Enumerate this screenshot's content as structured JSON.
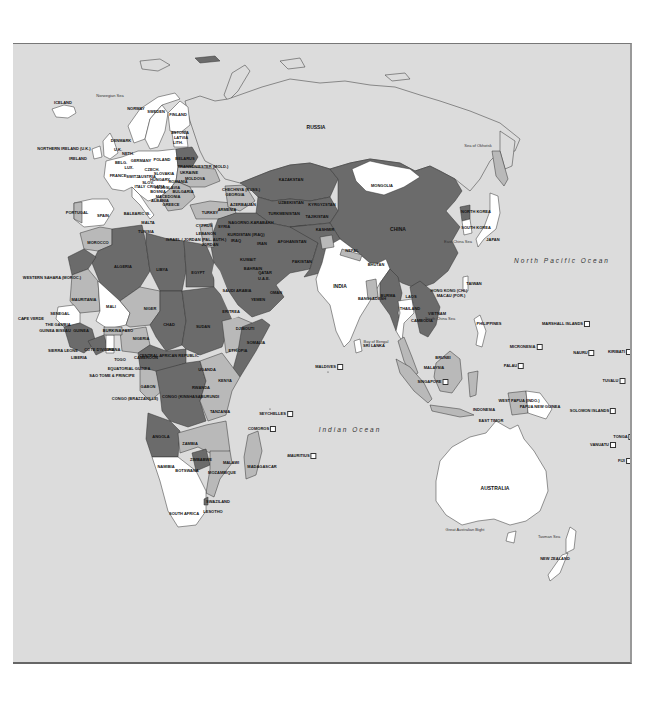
{
  "map": {
    "colors": {
      "ocean": "#dcdcdc",
      "dark": "#6b6b6b",
      "medium": "#b9b9b9",
      "light": "#ffffff",
      "border": "#333333"
    },
    "oceans": [
      {
        "id": "north-pacific",
        "label": "North Pacific Ocean",
        "x": 562,
        "y": 259
      },
      {
        "id": "indian",
        "label": "Indian Ocean",
        "x": 350,
        "y": 428
      }
    ],
    "seas": [
      {
        "id": "norwegian-sea",
        "label": "Norwegian Sea",
        "x": 110,
        "y": 95
      },
      {
        "id": "sea-of-okhotsk",
        "label": "Sea of Okhotsk",
        "x": 478,
        "y": 145
      },
      {
        "id": "east-china-sea",
        "label": "East China Sea",
        "x": 458,
        "y": 241
      },
      {
        "id": "south-china-sea",
        "label": "South China Sea",
        "x": 440,
        "y": 318
      },
      {
        "id": "bay-of-bengal",
        "label": "Bay of Bengal",
        "x": 376,
        "y": 341
      },
      {
        "id": "great-australian-bight",
        "label": "Great Australian Bight",
        "x": 465,
        "y": 529
      },
      {
        "id": "tasman-sea",
        "label": "Tasman Sea",
        "x": 549,
        "y": 536
      }
    ],
    "countries": [
      {
        "id": "iceland",
        "label": "ICELAND",
        "x": 63,
        "y": 102
      },
      {
        "id": "norway",
        "label": "NORWAY",
        "x": 136,
        "y": 108
      },
      {
        "id": "sweden",
        "label": "SWEDEN",
        "x": 156,
        "y": 111
      },
      {
        "id": "finland",
        "label": "FINLAND",
        "x": 178,
        "y": 114
      },
      {
        "id": "estonia",
        "label": "ESTONIA",
        "x": 180,
        "y": 132
      },
      {
        "id": "latvia",
        "label": "LATVIA",
        "x": 181,
        "y": 137
      },
      {
        "id": "lithuania",
        "label": "LITH.",
        "x": 178,
        "y": 142
      },
      {
        "id": "denmark",
        "label": "DENMARK",
        "x": 121,
        "y": 140
      },
      {
        "id": "northern-ireland",
        "label": "NORTHERN IRELAND (U.K.)",
        "x": 64,
        "y": 148
      },
      {
        "id": "uk",
        "label": "U.K.",
        "x": 118,
        "y": 149
      },
      {
        "id": "ireland",
        "label": "IRELAND",
        "x": 78,
        "y": 158
      },
      {
        "id": "netherlands",
        "label": "NETH.",
        "x": 128,
        "y": 153
      },
      {
        "id": "germany",
        "label": "GERMANY",
        "x": 141,
        "y": 160
      },
      {
        "id": "poland",
        "label": "POLAND",
        "x": 162,
        "y": 159
      },
      {
        "id": "belarus",
        "label": "BELARUS",
        "x": 185,
        "y": 158
      },
      {
        "id": "belgium",
        "label": "BELG.",
        "x": 121,
        "y": 162
      },
      {
        "id": "luxembourg",
        "label": "LUX.",
        "x": 129,
        "y": 167
      },
      {
        "id": "czech",
        "label": "CZECH.",
        "x": 152,
        "y": 169
      },
      {
        "id": "slovakia",
        "label": "SLOVAKIA",
        "x": 164,
        "y": 173
      },
      {
        "id": "ukraine",
        "label": "UKRAINE",
        "x": 189,
        "y": 172
      },
      {
        "id": "transdniester",
        "label": "TRANSDNIESTER (MOLD.)",
        "x": 203,
        "y": 166
      },
      {
        "id": "moldova",
        "label": "MOLDOVA",
        "x": 195,
        "y": 178
      },
      {
        "id": "france",
        "label": "FRANCE",
        "x": 118,
        "y": 175
      },
      {
        "id": "switzerland",
        "label": "SWITZ.",
        "x": 133,
        "y": 176
      },
      {
        "id": "austria",
        "label": "AUSTRIA",
        "x": 147,
        "y": 176
      },
      {
        "id": "hungary",
        "label": "HUNGARY",
        "x": 160,
        "y": 179
      },
      {
        "id": "romania",
        "label": "ROMANIA",
        "x": 178,
        "y": 181
      },
      {
        "id": "slovenia",
        "label": "SLOV.",
        "x": 148,
        "y": 182
      },
      {
        "id": "croatia",
        "label": "CROATIA",
        "x": 156,
        "y": 186
      },
      {
        "id": "yugoslavia",
        "label": "YUGOSLAVIA",
        "x": 167,
        "y": 187
      },
      {
        "id": "italy",
        "label": "ITALY",
        "x": 140,
        "y": 186
      },
      {
        "id": "bosnia",
        "label": "BOSNIA",
        "x": 158,
        "y": 191
      },
      {
        "id": "bulgaria",
        "label": "BULGARIA",
        "x": 183,
        "y": 191
      },
      {
        "id": "macedonia",
        "label": "MACEDONIA",
        "x": 168,
        "y": 196
      },
      {
        "id": "albania",
        "label": "ALBANIA",
        "x": 160,
        "y": 200
      },
      {
        "id": "greece",
        "label": "GREECE",
        "x": 171,
        "y": 204
      },
      {
        "id": "chechnya",
        "label": "CHECHNYA (RUSS.)",
        "x": 241,
        "y": 189
      },
      {
        "id": "georgia",
        "label": "GEORGIA",
        "x": 235,
        "y": 194
      },
      {
        "id": "armenia",
        "label": "ARMENIA",
        "x": 227,
        "y": 209
      },
      {
        "id": "azerbaijan",
        "label": "AZERBAIJAN",
        "x": 243,
        "y": 204
      },
      {
        "id": "turkey",
        "label": "TURKEY",
        "x": 210,
        "y": 212
      },
      {
        "id": "portugal",
        "label": "PORTUGAL",
        "x": 77,
        "y": 212
      },
      {
        "id": "spain",
        "label": "SPAIN",
        "x": 103,
        "y": 215
      },
      {
        "id": "balearic",
        "label": "BALEARIC IS.",
        "x": 137,
        "y": 213
      },
      {
        "id": "malta",
        "label": "MALTA",
        "x": 148,
        "y": 222
      },
      {
        "id": "tunisia",
        "label": "TUNISIA",
        "x": 146,
        "y": 231
      },
      {
        "id": "cyprus",
        "label": "CYPRUS",
        "x": 204,
        "y": 225
      },
      {
        "id": "lebanon",
        "label": "LEBANON",
        "x": 206,
        "y": 233
      },
      {
        "id": "israel",
        "label": "ISRAEL / JORDAN (PAL. AUTH.)",
        "x": 196,
        "y": 239
      },
      {
        "id": "jordan",
        "label": "JORDAN",
        "x": 210,
        "y": 244
      },
      {
        "id": "syria",
        "label": "SYRIA",
        "x": 224,
        "y": 226
      },
      {
        "id": "iraq",
        "label": "IRAQ",
        "x": 236,
        "y": 240
      },
      {
        "id": "iran",
        "label": "IRAN",
        "x": 262,
        "y": 243
      },
      {
        "id": "kurdistan",
        "label": "KURDISTAN (IRAQ)",
        "x": 246,
        "y": 234
      },
      {
        "id": "nagorno",
        "label": "NAGORNO-KARABAKH",
        "x": 251,
        "y": 222
      },
      {
        "id": "morocco",
        "label": "MOROCCO",
        "x": 98,
        "y": 242
      },
      {
        "id": "algeria",
        "label": "ALGERIA",
        "x": 123,
        "y": 266
      },
      {
        "id": "libya",
        "label": "LIBYA",
        "x": 162,
        "y": 269
      },
      {
        "id": "egypt",
        "label": "EGYPT",
        "x": 198,
        "y": 272
      },
      {
        "id": "western-sahara",
        "label": "WESTERN SAHARA (MOROC.)",
        "x": 52,
        "y": 277
      },
      {
        "id": "mauritania",
        "label": "MAURITANIA",
        "x": 84,
        "y": 299
      },
      {
        "id": "mali",
        "label": "MALI",
        "x": 111,
        "y": 306
      },
      {
        "id": "niger",
        "label": "NIGER",
        "x": 150,
        "y": 308
      },
      {
        "id": "chad",
        "label": "CHAD",
        "x": 169,
        "y": 324
      },
      {
        "id": "sudan",
        "label": "SUDAN",
        "x": 203,
        "y": 326
      },
      {
        "id": "eritrea",
        "label": "ERITREA",
        "x": 231,
        "y": 311
      },
      {
        "id": "senegal",
        "label": "SENEGAL",
        "x": 60,
        "y": 313
      },
      {
        "id": "cape-verde",
        "label": "CAPE VERDE",
        "x": 31,
        "y": 318
      },
      {
        "id": "the-gambia",
        "label": "THE GAMBIA",
        "x": 58,
        "y": 324
      },
      {
        "id": "guinea-bissau",
        "label": "GUINEA BISSAU",
        "x": 55,
        "y": 330
      },
      {
        "id": "guinea",
        "label": "GUINEA",
        "x": 81,
        "y": 330
      },
      {
        "id": "burkina-faso",
        "label": "BURKINA FASO",
        "x": 118,
        "y": 330
      },
      {
        "id": "nigeria",
        "label": "NIGERIA",
        "x": 141,
        "y": 338
      },
      {
        "id": "djibouti",
        "label": "DJIBOUTI",
        "x": 245,
        "y": 328
      },
      {
        "id": "somalia",
        "label": "SOMALIA",
        "x": 256,
        "y": 342
      },
      {
        "id": "ethiopia",
        "label": "ETHIOPIA",
        "x": 238,
        "y": 350
      },
      {
        "id": "sierra-leone",
        "label": "SIERRA LEONE",
        "x": 63,
        "y": 350
      },
      {
        "id": "cote-divoire",
        "label": "COTE D'IVOIRE",
        "x": 99,
        "y": 349
      },
      {
        "id": "ghana",
        "label": "GHANA",
        "x": 113,
        "y": 349
      },
      {
        "id": "liberia",
        "label": "LIBERIA",
        "x": 79,
        "y": 357
      },
      {
        "id": "togo",
        "label": "TOGO",
        "x": 120,
        "y": 359
      },
      {
        "id": "cameroon",
        "label": "CAMEROON",
        "x": 146,
        "y": 357
      },
      {
        "id": "car",
        "label": "CENTRAL AFRICAN REPUBLIC",
        "x": 169,
        "y": 355
      },
      {
        "id": "equatorial-guinea",
        "label": "EQUATORIAL GUINEA",
        "x": 129,
        "y": 368
      },
      {
        "id": "sao-tome",
        "label": "SAO TOME & PRINCIPE",
        "x": 112,
        "y": 375
      },
      {
        "id": "uganda",
        "label": "UGANDA",
        "x": 207,
        "y": 369
      },
      {
        "id": "kenya",
        "label": "KENYA",
        "x": 225,
        "y": 380
      },
      {
        "id": "gabon",
        "label": "GABON",
        "x": 148,
        "y": 386
      },
      {
        "id": "rwanda",
        "label": "RWANDA",
        "x": 201,
        "y": 387
      },
      {
        "id": "burundi",
        "label": "BURUNDI",
        "x": 210,
        "y": 396
      },
      {
        "id": "congo-brazzaville",
        "label": "CONGO (BRAZZAVILLE)",
        "x": 135,
        "y": 398
      },
      {
        "id": "congo-kinshasa",
        "label": "CONGO (KINSHASA)",
        "x": 182,
        "y": 396
      },
      {
        "id": "tanzania",
        "label": "TANZANIA",
        "x": 220,
        "y": 411
      },
      {
        "id": "angola",
        "label": "ANGOLA",
        "x": 161,
        "y": 436
      },
      {
        "id": "zambia",
        "label": "ZAMBIA",
        "x": 190,
        "y": 443
      },
      {
        "id": "malawi",
        "label": "MALAWI",
        "x": 231,
        "y": 462
      },
      {
        "id": "zimbabwe",
        "label": "ZIMBABWE",
        "x": 201,
        "y": 459
      },
      {
        "id": "namibia",
        "label": "NAMIBIA",
        "x": 166,
        "y": 466
      },
      {
        "id": "botswana",
        "label": "BOTSWANA",
        "x": 187,
        "y": 470
      },
      {
        "id": "mozambique",
        "label": "MOZAMBIQUE",
        "x": 222,
        "y": 472
      },
      {
        "id": "madagascar",
        "label": "MADAGASCAR",
        "x": 262,
        "y": 466
      },
      {
        "id": "swaziland",
        "label": "SWAZILAND",
        "x": 218,
        "y": 501
      },
      {
        "id": "lesotho",
        "label": "LESOTHO",
        "x": 213,
        "y": 511
      },
      {
        "id": "south-africa",
        "label": "SOUTH AFRICA",
        "x": 184,
        "y": 513
      },
      {
        "id": "russia",
        "label": "RUSSIA",
        "x": 316,
        "y": 126
      },
      {
        "id": "kazakhstan",
        "label": "KAZAKSTAN",
        "x": 291,
        "y": 179
      },
      {
        "id": "mongolia",
        "label": "MONGOLIA",
        "x": 382,
        "y": 185
      },
      {
        "id": "uzbekistan",
        "label": "UZBEKISTAN",
        "x": 291,
        "y": 202
      },
      {
        "id": "kyrgyzstan",
        "label": "KYRGYZSTAN",
        "x": 322,
        "y": 204
      },
      {
        "id": "turkmenistan",
        "label": "TURKMENISTAN",
        "x": 284,
        "y": 213
      },
      {
        "id": "tajikistan",
        "label": "TAJIKISTAN",
        "x": 317,
        "y": 216
      },
      {
        "id": "afghanistan",
        "label": "AFGHANISTAN",
        "x": 292,
        "y": 241
      },
      {
        "id": "pakistan",
        "label": "PAKISTAN",
        "x": 302,
        "y": 261
      },
      {
        "id": "kashmir",
        "label": "KASHMIR",
        "x": 325,
        "y": 229
      },
      {
        "id": "china",
        "label": "CHINA",
        "x": 398,
        "y": 228
      },
      {
        "id": "nepal",
        "label": "NEPAL",
        "x": 352,
        "y": 250
      },
      {
        "id": "bhutan",
        "label": "BHUTAN",
        "x": 376,
        "y": 264
      },
      {
        "id": "india",
        "label": "INDIA",
        "x": 340,
        "y": 285
      },
      {
        "id": "bangladesh",
        "label": "BANGLADESH",
        "x": 372,
        "y": 298
      },
      {
        "id": "burma",
        "label": "BURMA",
        "x": 388,
        "y": 295
      },
      {
        "id": "laos",
        "label": "LAOS",
        "x": 411,
        "y": 296
      },
      {
        "id": "thailand",
        "label": "THAILAND",
        "x": 410,
        "y": 308
      },
      {
        "id": "cambodia",
        "label": "CAMBODIA",
        "x": 422,
        "y": 320
      },
      {
        "id": "vietnam",
        "label": "VIETNAM",
        "x": 437,
        "y": 313
      },
      {
        "id": "sri-lanka",
        "label": "SRI LANKA",
        "x": 374,
        "y": 345
      },
      {
        "id": "kuwait",
        "label": "KUWAIT",
        "x": 248,
        "y": 259
      },
      {
        "id": "bahrain",
        "label": "BAHRAIN",
        "x": 253,
        "y": 268
      },
      {
        "id": "qatar",
        "label": "QATAR",
        "x": 265,
        "y": 272
      },
      {
        "id": "uae",
        "label": "U.A.E.",
        "x": 264,
        "y": 278
      },
      {
        "id": "saudi-arabia",
        "label": "SAUDI ARABIA",
        "x": 237,
        "y": 290
      },
      {
        "id": "oman",
        "label": "OMAN",
        "x": 276,
        "y": 292
      },
      {
        "id": "yemen",
        "label": "YEMEN",
        "x": 258,
        "y": 299
      },
      {
        "id": "north-korea",
        "label": "NORTH KOREA",
        "x": 476,
        "y": 211
      },
      {
        "id": "south-korea",
        "label": "SOUTH KOREA",
        "x": 476,
        "y": 227
      },
      {
        "id": "japan",
        "label": "JAPAN",
        "x": 493,
        "y": 239
      },
      {
        "id": "taiwan",
        "label": "TAIWAN",
        "x": 474,
        "y": 283
      },
      {
        "id": "hong-kong",
        "label": "HONG KONG (CHI.)",
        "x": 449,
        "y": 290
      },
      {
        "id": "macau",
        "label": "MACAU (POR.)",
        "x": 451,
        "y": 295
      },
      {
        "id": "philippines",
        "label": "PHILIPPINES",
        "x": 489,
        "y": 323
      },
      {
        "id": "marshall-islands",
        "label": "MARSHALL ISLANDS",
        "x": 566,
        "y": 323
      },
      {
        "id": "micronesia",
        "label": "MICRONESIA",
        "x": 526,
        "y": 346
      },
      {
        "id": "nauru",
        "label": "NAURU",
        "x": 584,
        "y": 352
      },
      {
        "id": "kiribati",
        "label": "KIRIBATI",
        "x": 620,
        "y": 351
      },
      {
        "id": "palau",
        "label": "PALAU",
        "x": 514,
        "y": 365
      },
      {
        "id": "brunei",
        "label": "BRUNEI",
        "x": 443,
        "y": 357
      },
      {
        "id": "malaysia",
        "label": "MALAYSIA",
        "x": 434,
        "y": 367
      },
      {
        "id": "singapore",
        "label": "SINGAPORE",
        "x": 433,
        "y": 381
      },
      {
        "id": "tuvalu",
        "label": "TUVALU",
        "x": 614,
        "y": 380
      },
      {
        "id": "indonesia",
        "label": "INDONESIA",
        "x": 484,
        "y": 409
      },
      {
        "id": "west-papua",
        "label": "WEST PAPUA (INDO.)",
        "x": 519,
        "y": 400
      },
      {
        "id": "papua-new-guinea",
        "label": "PAPUA NEW GUINEA",
        "x": 540,
        "y": 406
      },
      {
        "id": "east-timor",
        "label": "EAST TIMOR",
        "x": 491,
        "y": 420
      },
      {
        "id": "solomon-islands",
        "label": "SOLOMON ISLANDS",
        "x": 593,
        "y": 410
      },
      {
        "id": "tonga",
        "label": "TONGA",
        "x": 624,
        "y": 436
      },
      {
        "id": "vanuatu",
        "label": "VANUATU",
        "x": 603,
        "y": 444
      },
      {
        "id": "fiji",
        "label": "FIJI",
        "x": 625,
        "y": 460
      },
      {
        "id": "australia",
        "label": "AUSTRALIA",
        "x": 495,
        "y": 487
      },
      {
        "id": "new-zealand",
        "label": "NEW ZEALAND",
        "x": 555,
        "y": 558
      },
      {
        "id": "maldives",
        "label": "MALDIVES",
        "x": 329,
        "y": 366
      },
      {
        "id": "seychelles",
        "label": "SEYCHELLES",
        "x": 276,
        "y": 413
      },
      {
        "id": "comoros",
        "label": "COMOROS",
        "x": 262,
        "y": 428
      },
      {
        "id": "mauritius",
        "label": "MAURITIUS",
        "x": 302,
        "y": 455
      }
    ]
  }
}
